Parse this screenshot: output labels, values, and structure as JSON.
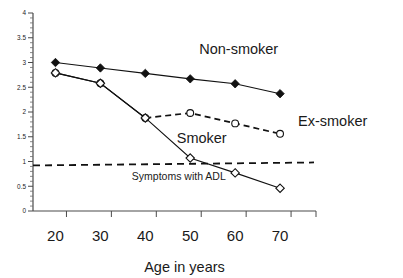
{
  "chart_data": {
    "type": "line",
    "title": "",
    "xlabel": "Age in years",
    "ylabel": "",
    "x": [
      20,
      30,
      40,
      50,
      60,
      70
    ],
    "xlim": [
      15,
      78
    ],
    "ylim": [
      0,
      4
    ],
    "grid": false,
    "legend_position": "inline-annotations",
    "x_ticks": [
      "20",
      "30",
      "40",
      "50",
      "60",
      "70"
    ],
    "y_ticks": [
      "0",
      "0.5",
      "1",
      "1.5",
      "2",
      "2.5",
      "3",
      "3.5",
      "4"
    ],
    "y_tick_values": [
      0,
      0.5,
      1,
      1.5,
      2,
      2.5,
      3,
      3.5,
      4
    ],
    "y_minor_step": 0.1,
    "series": [
      {
        "name": "Non-smoker",
        "marker": "filled-diamond",
        "linestyle": "solid",
        "x": [
          20,
          30,
          40,
          50,
          60,
          70
        ],
        "values": [
          3.0,
          2.89,
          2.78,
          2.67,
          2.57,
          2.37
        ]
      },
      {
        "name": "Ex-smoker",
        "marker": "open-circle",
        "linestyle": "solid-then-dashed",
        "x": [
          20,
          30,
          40,
          50,
          60,
          70
        ],
        "values": [
          2.79,
          2.58,
          1.88,
          1.98,
          1.77,
          1.56
        ]
      },
      {
        "name": "Smoker",
        "marker": "open-diamond",
        "linestyle": "solid",
        "x": [
          20,
          30,
          40,
          50,
          60,
          70
        ],
        "values": [
          2.79,
          2.58,
          1.88,
          1.07,
          0.77,
          0.46
        ]
      }
    ],
    "reference_line": {
      "label": "Symptoms with ADL",
      "y": 0.95,
      "linestyle": "dashed"
    },
    "annotations": [
      {
        "text": "Non-smoker",
        "x": 52,
        "y": 3.18
      },
      {
        "text": "Ex-smoker",
        "x": 74,
        "y": 1.72
      },
      {
        "text": "Smoker",
        "x": 47,
        "y": 1.38
      },
      {
        "text": "Symptoms with ADL",
        "x": 37,
        "y": 0.62
      }
    ],
    "colors": {
      "line": "#111111",
      "axis": "#4a4a4a",
      "text": "#1a1a1a",
      "background": "#ffffff"
    }
  }
}
